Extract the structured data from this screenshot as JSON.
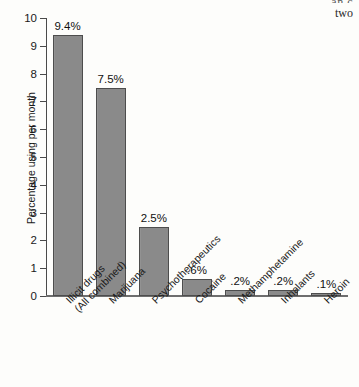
{
  "page_text": {
    "clipped_line": "an c",
    "visible_word": "two"
  },
  "chart_data": {
    "type": "bar",
    "title": "",
    "xlabel": "",
    "ylabel": "Percentage using per month",
    "ylim": [
      0,
      10
    ],
    "grid": false,
    "legend": "none",
    "ytick_labels": [
      "0",
      "1",
      "2",
      "3",
      "4",
      "5",
      "6",
      "7",
      "8",
      "9",
      "10"
    ],
    "ytick_values": [
      0,
      1,
      2,
      3,
      4,
      5,
      6,
      7,
      8,
      9,
      10
    ],
    "categories": [
      "Illicit drugs\n(All combined)",
      "Marijuana",
      "Psychotherapeutics",
      "Cocaine",
      "Methamphetamine",
      "Inhalants",
      "Heroin"
    ],
    "values": [
      9.4,
      7.5,
      2.5,
      0.6,
      0.2,
      0.2,
      0.1
    ],
    "data_labels": [
      "9.4%",
      "7.5%",
      "2.5%",
      ".6%",
      ".2%",
      ".2%",
      ".1%"
    ],
    "bar_color": "#8a8a8a",
    "bar_edge_color": "#4d4d4d",
    "axis_color": "#4a4a4a"
  }
}
